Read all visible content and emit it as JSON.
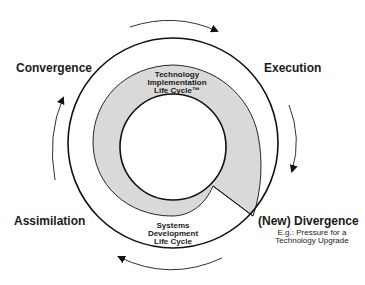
{
  "diagram": {
    "phases": {
      "convergence": "Convergence",
      "execution": "Execution",
      "divergence": "(New) Divergence",
      "assimilation": "Assimilation"
    },
    "divergence_note": [
      "E.g.: Pressure for a",
      "Technology Upgrade"
    ],
    "tilc_label": [
      "Technology",
      "Implementation",
      "Life Cycle™"
    ],
    "sdlc_label": [
      "Systems",
      "Development",
      "Life Cycle"
    ],
    "colors": {
      "stroke": "#111111",
      "shade": "#d9d9d9",
      "background": "#ffffff"
    }
  }
}
